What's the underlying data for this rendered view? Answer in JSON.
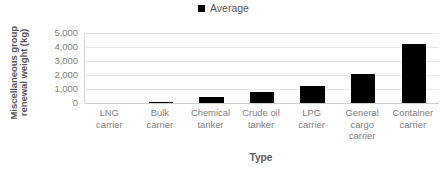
{
  "chart_data": {
    "type": "bar",
    "title": "",
    "categories": [
      "LNG carrier",
      "Bulk carrier",
      "Chemical tanker",
      "Crude oil tanker",
      "LPG carrier",
      "General cargo carrier",
      "Container carrier"
    ],
    "categories_lines": [
      [
        "LNG",
        "carrier"
      ],
      [
        "Bulk",
        "carrier"
      ],
      [
        "Chemical",
        "tanker"
      ],
      [
        "Crude oil",
        "tanker"
      ],
      [
        "LPG",
        "carrier"
      ],
      [
        "General",
        "cargo",
        "carrier"
      ],
      [
        "Container",
        "carrier"
      ]
    ],
    "series": [
      {
        "name": "Average",
        "color": "#000000",
        "values": [
          0,
          60,
          420,
          780,
          1230,
          2050,
          4180
        ]
      }
    ],
    "values": [
      0,
      60,
      420,
      780,
      1230,
      2050,
      4180
    ],
    "xlabel": "Type",
    "ylabel": "Miscellaneous group renewal weight (kg)",
    "ylabel_lines": [
      "Miscellaneous group",
      "renewal weight (kg)"
    ],
    "ylim": [
      0,
      5000
    ],
    "yticks": [
      0,
      1000,
      2000,
      3000,
      4000,
      5000
    ],
    "ytick_labels": [
      "0",
      "1,000",
      "2,000",
      "3,000",
      "4,000",
      "5,000"
    ],
    "grid": "horizontal",
    "legend_position": "top-center",
    "legend": [
      {
        "label": "Average",
        "marker": "square",
        "color": "#000000"
      }
    ]
  },
  "colors": {
    "bar": "#000000",
    "grid": "#e8e8e8",
    "axis": "#d9d9d9",
    "tick_text": "#808080",
    "title_text": "#595959",
    "background": "#ffffff"
  }
}
